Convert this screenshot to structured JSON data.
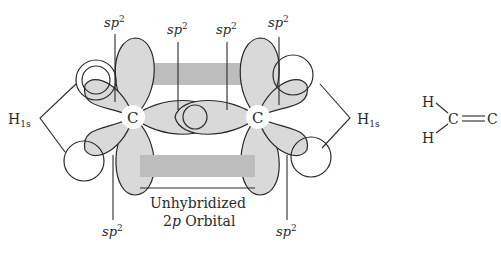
{
  "diagram": {
    "labels": {
      "sp2_top": [
        "sp",
        "sp",
        "sp",
        "sp"
      ],
      "sp2_top_exp": "2",
      "sp2_bottom": [
        "sp",
        "sp"
      ],
      "sp2_bottom_exp": "2",
      "h_left": "H",
      "h_left_sub": "1s",
      "h_right": "H",
      "h_right_sub": "1s",
      "carbon_left": "C",
      "carbon_right": "C",
      "unhybridized_line1": "Unhybridized",
      "unhybridized_line2_pre": "2",
      "unhybridized_line2_it": "p",
      "unhybridized_line2_post": " Orbital"
    },
    "structure": {
      "h_top": "H",
      "h_bottom": "H",
      "c_left": "C",
      "c_right": "C",
      "bond": "double"
    },
    "colors": {
      "lobe_fill": "#d9d9d9",
      "p_orbital_fill": "#bdbdbd",
      "stroke": "#2a2a2a"
    }
  }
}
